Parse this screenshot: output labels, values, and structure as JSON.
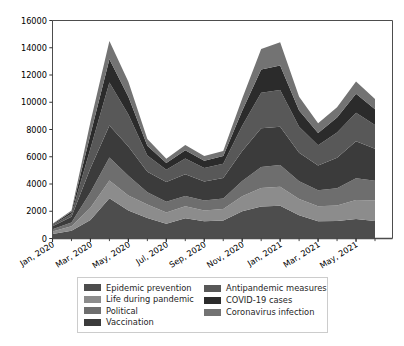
{
  "chart_data": {
    "type": "area",
    "stacked": true,
    "title": "",
    "xlabel": "",
    "ylabel": "",
    "ylim": [
      0,
      16000
    ],
    "ytick_values": [
      0,
      2000,
      4000,
      6000,
      8000,
      10000,
      12000,
      14000,
      16000
    ],
    "ytick_labels": [
      "0",
      "2000",
      "4000",
      "6000",
      "8000",
      "10000",
      "12000",
      "14000",
      "16000"
    ],
    "grid": false,
    "legend_position": "below-axes",
    "x": [
      "Jan, 2020",
      "Feb, 2020",
      "Mar, 2020",
      "Apr, 2020",
      "May, 2020",
      "Jun, 2020",
      "Jul, 2020",
      "Aug, 2020",
      "Sep, 2020",
      "Oct, 2020",
      "Nov, 2020",
      "Dec, 2020",
      "Jan, 2021",
      "Feb, 2021",
      "Mar, 2021",
      "Apr, 2021",
      "May, 2021",
      "Jun, 2021"
    ],
    "xtick_labels": [
      "Jan, 2020",
      "Mar, 2020",
      "May, 2020",
      "Jul, 2020",
      "Sep, 2020",
      "Nov, 2020",
      "Jan, 2021",
      "Mar, 2021",
      "May, 2021"
    ],
    "xtick_indices": [
      0,
      2,
      4,
      6,
      8,
      10,
      12,
      14,
      16
    ],
    "series": [
      {
        "name": "Epidemic prevention",
        "color": "#4d4d4d",
        "values": [
          330,
          560,
          1350,
          2950,
          2050,
          1500,
          1080,
          1480,
          1260,
          1320,
          2000,
          2350,
          2400,
          1700,
          1270,
          1280,
          1430,
          1280
        ]
      },
      {
        "name": "Life during pandemic",
        "color": "#8c8c8c",
        "values": [
          190,
          330,
          900,
          1300,
          1100,
          1000,
          820,
          880,
          800,
          840,
          1100,
          1350,
          1400,
          1200,
          1100,
          1150,
          1400,
          1500
        ]
      },
      {
        "name": "Political",
        "color": "#6e6e6e",
        "values": [
          160,
          280,
          1150,
          1700,
          1450,
          900,
          800,
          760,
          720,
          780,
          1120,
          1550,
          1600,
          1300,
          1180,
          1250,
          1600,
          1450
        ]
      },
      {
        "name": "Vaccination",
        "color": "#3b3b3b",
        "values": [
          220,
          420,
          1750,
          2350,
          2150,
          1500,
          1450,
          1600,
          1400,
          1500,
          2200,
          2850,
          2800,
          2100,
          1800,
          2250,
          2700,
          2350
        ]
      },
      {
        "name": "Antipandemic measures",
        "color": "#585858",
        "values": [
          90,
          220,
          1450,
          3150,
          2350,
          1200,
          900,
          1150,
          1000,
          1050,
          1850,
          2600,
          2700,
          1900,
          1500,
          1850,
          2100,
          1750
        ]
      },
      {
        "name": "COVID-19 cases",
        "color": "#2b2b2b",
        "values": [
          60,
          150,
          1050,
          1700,
          1300,
          700,
          500,
          600,
          520,
          560,
          1100,
          1700,
          1800,
          1200,
          900,
          1100,
          1400,
          1150
        ]
      },
      {
        "name": "Coronavirus infection",
        "color": "#737373",
        "values": [
          30,
          90,
          900,
          1350,
          1100,
          500,
          300,
          400,
          350,
          380,
          900,
          1500,
          1700,
          1000,
          700,
          750,
          900,
          750
        ]
      }
    ]
  },
  "legend": {
    "columns": [
      {
        "entries": [
          {
            "label": "Epidemic prevention",
            "color": "#4d4d4d",
            "swatch_name": "legend-swatch-epidemic-prevention"
          },
          {
            "label": "Life during pandemic",
            "color": "#8c8c8c",
            "swatch_name": "legend-swatch-life-during-pandemic"
          },
          {
            "label": "Political",
            "color": "#6e6e6e",
            "swatch_name": "legend-swatch-political"
          },
          {
            "label": "Vaccination",
            "color": "#3b3b3b",
            "swatch_name": "legend-swatch-vaccination"
          }
        ]
      },
      {
        "entries": [
          {
            "label": "Antipandemic measures",
            "color": "#585858",
            "swatch_name": "legend-swatch-antipandemic-measures"
          },
          {
            "label": "COVID-19 cases",
            "color": "#2b2b2b",
            "swatch_name": "legend-swatch-covid-19-cases"
          },
          {
            "label": "Coronavirus infection",
            "color": "#737373",
            "swatch_name": "legend-swatch-coronavirus-infection"
          }
        ]
      }
    ]
  },
  "axes": {
    "spine_color": "#4d4d4d",
    "tick_color": "#333333"
  }
}
